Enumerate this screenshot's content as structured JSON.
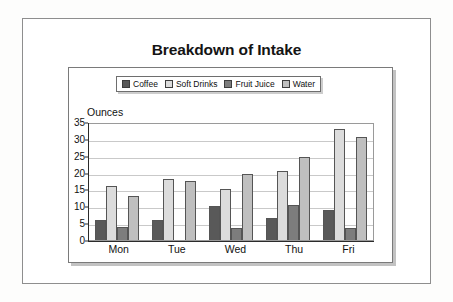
{
  "chart_data": {
    "type": "bar",
    "title": "Breakdown of Intake",
    "xlabel": "",
    "ylabel": "Ounces",
    "categories": [
      "Mon",
      "Tue",
      "Wed",
      "Thu",
      "Fri"
    ],
    "series": [
      {
        "name": "Coffee",
        "color": "#595959",
        "values": [
          6,
          6,
          10,
          6.5,
          9
        ]
      },
      {
        "name": "Soft Drinks",
        "color": "#dcdcdc",
        "values": [
          16,
          18,
          15,
          20.5,
          33
        ]
      },
      {
        "name": "Fruit Juice",
        "color": "#7d7d7d",
        "values": [
          4,
          0,
          3.5,
          10.5,
          3.5
        ]
      },
      {
        "name": "Water",
        "color": "#bfbfbf",
        "values": [
          13,
          17.5,
          19.5,
          24.5,
          30.5
        ]
      }
    ],
    "ylim": [
      0,
      35
    ],
    "yticks": [
      0,
      5,
      10,
      15,
      20,
      25,
      30,
      35
    ],
    "grid": true,
    "legend_position": "top-center"
  },
  "legend": {
    "items": [
      {
        "label": "Coffee"
      },
      {
        "label": "Soft Drinks"
      },
      {
        "label": "Fruit Juice"
      },
      {
        "label": "Water"
      }
    ]
  }
}
